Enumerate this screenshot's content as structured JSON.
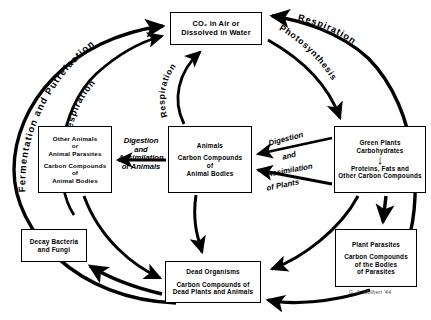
{
  "diagram": {
    "signature": "G. A. Mulbert '44",
    "boxes": {
      "co2": {
        "name": "co2-box",
        "lines": [
          "CO₂ in Air or",
          "Dissolved in Water"
        ]
      },
      "other_animals": {
        "name": "other-animals-box",
        "group_a": [
          "Other Animals",
          "or",
          "Animal Parasites"
        ],
        "group_b": [
          "Carbon Compounds",
          "of",
          "Animal Bodies"
        ]
      },
      "animals": {
        "name": "animals-box",
        "group_a": [
          "Animals"
        ],
        "group_b": [
          "Carbon Compounds",
          "of",
          "Animal Bodies"
        ]
      },
      "green_plants": {
        "name": "green-plants-box",
        "group_a": [
          "Green Plants",
          "Carbohydrates"
        ],
        "group_b": [
          "Proteins, Fats and",
          "Other Carbon Compounds"
        ]
      },
      "decay": {
        "name": "decay-bacteria-box",
        "lines": [
          "Decay Bacteria",
          "and Fungi"
        ]
      },
      "dead_organisms": {
        "name": "dead-organisms-box",
        "group_a": [
          "Dead Organisms"
        ],
        "group_b": [
          "Carbon Compounds of",
          "Dead Plants and Animals"
        ]
      },
      "plant_parasites": {
        "name": "plant-parasites-box",
        "group_a": [
          "Plant Parasites"
        ],
        "group_b": [
          "Carbon Compounds",
          "of the Bodies",
          "of Parasites"
        ]
      }
    },
    "arrow_labels": {
      "fermentation": "Fermentation and Putrefaction",
      "respiration_left": "Respiration",
      "respiration_center": "Respiration",
      "respiration_right": "Respiration",
      "photosynthesis": "Photosynthesis",
      "digestion_animals_line1": "Digestion",
      "digestion_animals_line2": "and",
      "digestion_animals_line3": "Assimilation",
      "digestion_animals_line4": "of Animals",
      "digestion_plants_line1": "Digestion",
      "digestion_plants_line2": "and",
      "digestion_plants_line3": "Assimilation",
      "digestion_plants_line4": "of Plants"
    },
    "colors": {
      "stroke": "#000000",
      "background": "#ffffff"
    }
  }
}
